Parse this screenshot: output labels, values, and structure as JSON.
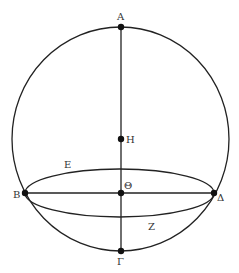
{
  "figure": {
    "type": "geometric-diagram",
    "stroke_color": "#222222",
    "background": "#ffffff"
  },
  "points": {
    "A": {
      "label": "Α",
      "x": 121,
      "y": 27
    },
    "H": {
      "label": "Η",
      "x": 121,
      "y": 139
    },
    "Theta": {
      "label": "Θ",
      "x": 121,
      "y": 193
    },
    "B": {
      "label": "Β",
      "x": 25,
      "y": 193
    },
    "Delta": {
      "label": "Δ",
      "x": 214,
      "y": 193
    },
    "Gamma": {
      "label": "Γ",
      "x": 121,
      "y": 251
    }
  },
  "curve_labels": {
    "E": {
      "label": "Ε",
      "x": 68,
      "y": 167
    },
    "Z": {
      "label": "Ζ",
      "x": 152,
      "y": 229
    }
  },
  "outer_circle": {
    "cx": 120.5,
    "cy": 139,
    "rx": 108.5,
    "ry": 112
  },
  "inner_ellipse": {
    "cx": 119.5,
    "cy": 193,
    "rx": 94.5,
    "ry": 24
  }
}
